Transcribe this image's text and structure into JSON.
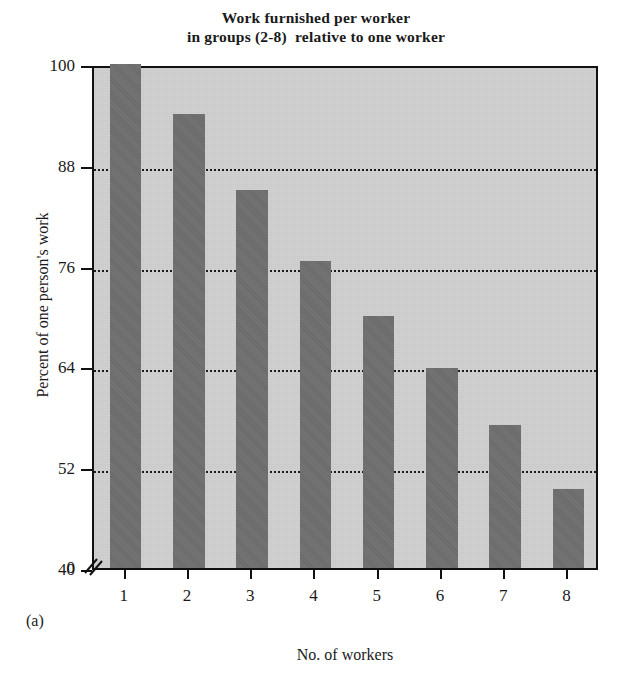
{
  "chart_data": {
    "type": "bar",
    "title": "Work furnished per worker in groups (2-8) relative to one worker",
    "title_lines": [
      "Work furnished per worker",
      "in groups (2-8)  relative to one worker"
    ],
    "xlabel": "No. of workers",
    "ylabel": "Percent of one person's work",
    "panel_label": "(a)",
    "categories": [
      "1",
      "2",
      "3",
      "4",
      "5",
      "6",
      "7",
      "8"
    ],
    "values": [
      100,
      94,
      85,
      76.5,
      70,
      63.8,
      57,
      49.4
    ],
    "ylim": [
      40,
      100
    ],
    "y_axis_break": true,
    "y_zero_label": "0",
    "yticks": [
      40,
      52,
      64,
      76,
      88,
      100
    ],
    "ytick_labels": [
      "40",
      "52",
      "64",
      "76",
      "88",
      "100"
    ],
    "gridlines": [
      52,
      64,
      76,
      88
    ],
    "grid": true,
    "legend": null,
    "colors": {
      "bar_fill": "#6e6e6e",
      "plot_background": "#c9c9c9",
      "axis": "#111111",
      "gridline": "#1b1b1b",
      "page_background": "#ffffff",
      "text": "#1a1a1a"
    }
  }
}
